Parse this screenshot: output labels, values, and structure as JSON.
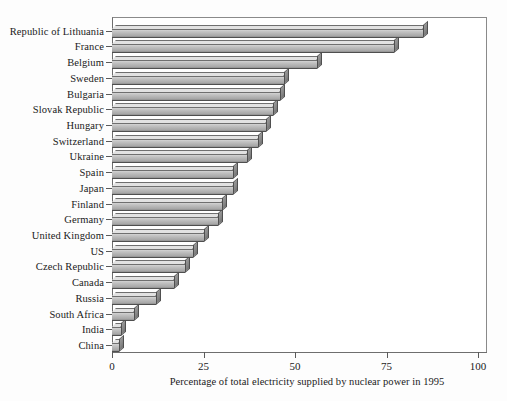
{
  "chart_data": {
    "type": "bar",
    "orientation": "horizontal",
    "title": "",
    "xlabel": "Percentage of total electricity supplied by nuclear power in 1995",
    "ylabel": "",
    "xlim": [
      0,
      100
    ],
    "xticks": [
      0,
      25,
      50,
      75,
      100
    ],
    "xtick_labels": [
      "0",
      "25",
      "50",
      "75",
      "100"
    ],
    "grid": false,
    "legend": false,
    "style": "3d-bar",
    "bar_color": "#b4b4b4",
    "bar_edge_color": "#4f4f4f",
    "categories": [
      "China",
      "India",
      "South Africa",
      "Russia",
      "Canada",
      "Czech Republic",
      "US",
      "United Kingdom",
      "Germany",
      "Finland",
      "Japan",
      "Spain",
      "Ukraine",
      "Switzerland",
      "Hungary",
      "Slovak Republic",
      "Bulgaria",
      "Sweden",
      "Belgium",
      "France",
      "Republic of Lithuania"
    ],
    "values": [
      2,
      2.5,
      6,
      12,
      17,
      20,
      22,
      25,
      29,
      30,
      33,
      33,
      37,
      40,
      42,
      44,
      46,
      47,
      56,
      77,
      85
    ],
    "units": "percent"
  },
  "axis": {
    "caption": "Percentage of total electricity supplied by nuclear power in 1995"
  }
}
